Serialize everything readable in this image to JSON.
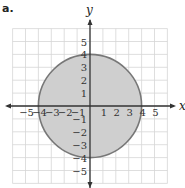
{
  "part_label": "a.",
  "axes": {
    "x_label": "x",
    "y_label": "y",
    "x_ticks": [
      "−5",
      "−4",
      "−3",
      "−2",
      "−1",
      "1",
      "2",
      "3",
      "4",
      "5"
    ],
    "y_ticks": [
      "5",
      "4",
      "3",
      "2",
      "1",
      "−1",
      "−2",
      "−3",
      "−4",
      "−5"
    ]
  },
  "circle": {
    "center": [
      0,
      0
    ],
    "radius": 4,
    "fill": "#cfcfcf",
    "stroke": "#777777"
  },
  "grid": {
    "min": -6,
    "max": 6,
    "color": "#d6d6d6"
  }
}
